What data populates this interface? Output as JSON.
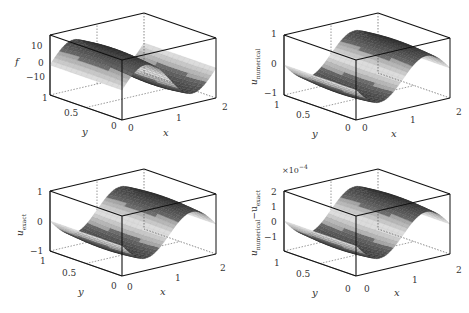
{
  "figure": {
    "panels": [
      {
        "id": "f",
        "zlabel": "f",
        "zlabel_sub": "",
        "zticks": [
          "10",
          "0",
          "−10"
        ],
        "zrange": [
          -18,
          18
        ],
        "amplitude": 14,
        "phase_sign": 1,
        "multiplier": ""
      },
      {
        "id": "u_numerical",
        "zlabel": "u",
        "zlabel_sub": "numerical",
        "zticks": [
          "1",
          "0",
          "−1"
        ],
        "zrange": [
          -1,
          1
        ],
        "amplitude": 0.7,
        "phase_sign": -1,
        "multiplier": ""
      },
      {
        "id": "u_exact",
        "zlabel": "u",
        "zlabel_sub": "exact",
        "zticks": [
          "1",
          "0",
          "−1"
        ],
        "zrange": [
          -1,
          1
        ],
        "amplitude": 0.7,
        "phase_sign": -1,
        "multiplier": ""
      },
      {
        "id": "error",
        "zlabel": "u",
        "zlabel_sub": "numerical",
        "zlabel_tail": "−u",
        "zlabel_tail_sub": "exact",
        "zticks": [
          "2",
          "1",
          "0",
          "−1"
        ],
        "zrange": [
          -2,
          2
        ],
        "amplitude": 1.4,
        "phase_sign": -1,
        "multiplier_base": "×10",
        "multiplier_exp": "−4"
      }
    ],
    "x_axis": {
      "label": "x",
      "ticks": [
        "0",
        "1",
        "2"
      ]
    },
    "y_axis": {
      "label": "y",
      "ticks": [
        "0",
        "0.5",
        "1"
      ]
    }
  },
  "chart_data": [
    {
      "type": "surface",
      "title": "",
      "xlabel": "x",
      "ylabel": "y",
      "zlabel": "f",
      "xlim": [
        0,
        2
      ],
      "ylim": [
        0,
        1
      ],
      "zlim": [
        -18,
        18
      ],
      "x_ticks": [
        0,
        1,
        2
      ],
      "y_ticks": [
        0,
        0.5,
        1
      ],
      "z_ticks": [
        -10,
        0,
        10
      ],
      "surface": "sinusoidal in x (one full period over [0,2]), peak ~+14 near x≈1.5, trough ~−14 near x≈0.5, constant-ish along y",
      "grid": true
    },
    {
      "type": "surface",
      "title": "",
      "xlabel": "x",
      "ylabel": "y",
      "zlabel": "u_numerical",
      "xlim": [
        0,
        2
      ],
      "ylim": [
        0,
        1
      ],
      "zlim": [
        -1,
        1
      ],
      "x_ticks": [
        0,
        1,
        2
      ],
      "y_ticks": [
        0,
        0.5,
        1
      ],
      "z_ticks": [
        -1,
        0,
        1
      ],
      "surface": "sinusoidal in x, peak ~+0.7 near x≈0.5, trough ~−0.7 near x≈1.5",
      "grid": true
    },
    {
      "type": "surface",
      "title": "",
      "xlabel": "x",
      "ylabel": "y",
      "zlabel": "u_exact",
      "xlim": [
        0,
        2
      ],
      "ylim": [
        0,
        1
      ],
      "zlim": [
        -1,
        1
      ],
      "x_ticks": [
        0,
        1,
        2
      ],
      "y_ticks": [
        0,
        0.5,
        1
      ],
      "z_ticks": [
        -1,
        0,
        1
      ],
      "surface": "sinusoidal in x, peak ~+0.7 near x≈0.5, trough ~−0.7 near x≈1.5",
      "grid": true
    },
    {
      "type": "surface",
      "title": "",
      "xlabel": "x",
      "ylabel": "y",
      "zlabel": "u_numerical − u_exact",
      "xlim": [
        0,
        2
      ],
      "ylim": [
        0,
        1
      ],
      "zlim": [
        -0.0002,
        0.0002
      ],
      "z_multiplier": "×10^-4",
      "x_ticks": [
        0,
        1,
        2
      ],
      "y_ticks": [
        0,
        0.5,
        1
      ],
      "z_ticks": [
        -1,
        0,
        1,
        2
      ],
      "surface": "sinusoidal in x, peak ~+1.4e-4 near x≈0.5, trough ~−1.4e-4 near x≈1.5",
      "grid": true
    }
  ]
}
